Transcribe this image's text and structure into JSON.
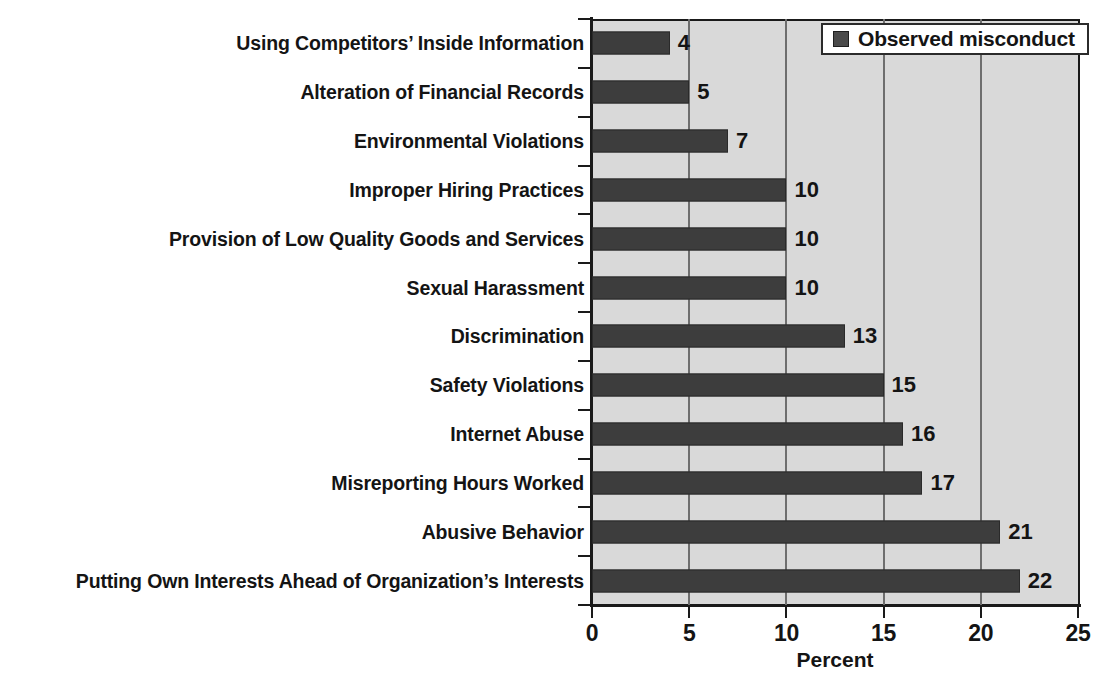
{
  "chart_data": {
    "type": "bar",
    "orientation": "horizontal",
    "title": "",
    "xlabel": "Percent",
    "ylabel": "",
    "xlim": [
      0,
      25
    ],
    "xticks": [
      0,
      5,
      10,
      15,
      20,
      25
    ],
    "xtick_labels": [
      "0",
      "5",
      "10",
      "15",
      "20",
      "25"
    ],
    "grid": "vertical",
    "legend": {
      "position": "top-right",
      "entries": [
        {
          "label": "Observed misconduct",
          "color": "#3d3d3d",
          "marker": "square"
        }
      ]
    },
    "categories": [
      "Using Competitors’ Inside Information",
      "Alteration of Financial Records",
      "Environmental Violations",
      "Improper Hiring Practices",
      "Provision of Low Quality Goods and Services",
      "Sexual Harassment",
      "Discrimination",
      "Safety Violations",
      "Internet Abuse",
      "Misreporting Hours Worked",
      "Abusive Behavior",
      "Putting Own Interests Ahead of Organization’s Interests"
    ],
    "series": [
      {
        "name": "Observed misconduct",
        "values": [
          4,
          5,
          7,
          10,
          10,
          10,
          13,
          15,
          16,
          17,
          21,
          22
        ]
      }
    ],
    "data_labels": [
      "4",
      "5",
      "7",
      "10",
      "10",
      "10",
      "13",
      "15",
      "16",
      "17",
      "21",
      "22"
    ],
    "colors": {
      "bar": "#3d3d3d",
      "plot_background": "#d9d9d9",
      "figure_background": "#ffffff",
      "axis": "#1a1a1a",
      "gridline": "#6e6e6e",
      "text": "#141414"
    }
  }
}
